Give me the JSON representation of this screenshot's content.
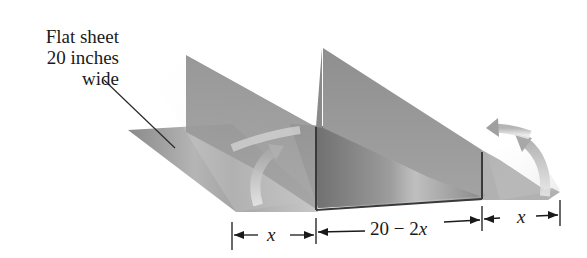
{
  "figure": {
    "type": "diagram",
    "callout": {
      "lines": [
        "Flat sheet",
        "20 inches",
        "wide"
      ]
    },
    "dimensions": {
      "left_label_var": "x",
      "middle_label_num": "20 − 2",
      "middle_label_var": "x",
      "right_label_var": "x"
    },
    "colors": {
      "sheet_gray": "#8c8c8c",
      "flap_gray": "#9a9a9a",
      "edge_dark": "#3a3a3a",
      "text": "#1a1a1a"
    }
  }
}
